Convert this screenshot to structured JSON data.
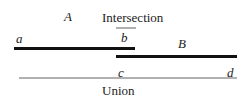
{
  "diagram": {
    "labels": {
      "set_a": "A",
      "set_b": "B",
      "intersection": "Intersection",
      "union": "Union",
      "point_a": "a",
      "point_b": "b",
      "point_c": "c",
      "point_d": "d"
    },
    "colors": {
      "segment": "#111111",
      "result": "#b0b0b0"
    }
  }
}
